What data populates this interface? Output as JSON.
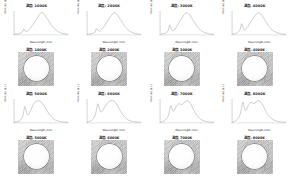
{
  "figure": {
    "background": "#ffffff",
    "curve_color": "#8a8a8a",
    "axis_color": "#6f6f6f",
    "rows": 4,
    "columns": 4
  },
  "axes": {
    "xlabel": "Wavelength (nm)",
    "ylabel": "Intensity (a.u.)"
  },
  "blocks": [
    {
      "spectra": [
        {
          "title": "温度: 1000K"
        },
        {
          "title": "温度: 2000K"
        },
        {
          "title": "温度: 3000K"
        },
        {
          "title": "温度: 4000K"
        }
      ],
      "images": [
        {
          "title": "温度: 1000K"
        },
        {
          "title": "温度: 2000K"
        },
        {
          "title": "温度: 3000K"
        },
        {
          "title": "温度: 4000K"
        }
      ]
    },
    {
      "spectra": [
        {
          "title": "温度: 5000K"
        },
        {
          "title": "温度: 6000K"
        },
        {
          "title": "温度: 7000K"
        },
        {
          "title": "温度: 8000K"
        }
      ],
      "images": [
        {
          "title": "温度: 5000K"
        },
        {
          "title": "温度: 6000K"
        },
        {
          "title": "温度: 7000K"
        },
        {
          "title": "温度: 8000K"
        }
      ]
    }
  ],
  "chart_data": {
    "type": "line",
    "title": "",
    "xlabel": "Wavelength (nm)",
    "ylabel": "Intensity (a.u.)",
    "xlim": [
      380,
      780
    ],
    "ylim": [
      0,
      1.05
    ],
    "grid": false,
    "legend": "none",
    "x": [
      380,
      400,
      420,
      440,
      450,
      460,
      470,
      480,
      490,
      500,
      510,
      520,
      530,
      540,
      550,
      560,
      570,
      580,
      590,
      600,
      610,
      620,
      630,
      640,
      650,
      660,
      680,
      700,
      720,
      740,
      760,
      780
    ],
    "series": [
      {
        "name": "温度: 1000K",
        "values": [
          0.02,
          0.03,
          0.05,
          0.12,
          0.26,
          0.2,
          0.14,
          0.16,
          0.22,
          0.3,
          0.38,
          0.46,
          0.55,
          0.64,
          0.74,
          0.84,
          0.93,
          0.99,
          1.0,
          0.96,
          0.88,
          0.78,
          0.7,
          0.6,
          0.5,
          0.41,
          0.27,
          0.17,
          0.1,
          0.06,
          0.04,
          0.02
        ]
      },
      {
        "name": "温度: 2000K",
        "values": [
          0.02,
          0.03,
          0.06,
          0.14,
          0.28,
          0.22,
          0.16,
          0.18,
          0.24,
          0.33,
          0.42,
          0.51,
          0.6,
          0.69,
          0.78,
          0.87,
          0.95,
          1.0,
          0.99,
          0.94,
          0.86,
          0.76,
          0.67,
          0.57,
          0.47,
          0.38,
          0.25,
          0.15,
          0.09,
          0.05,
          0.03,
          0.02
        ]
      },
      {
        "name": "温度: 3000K",
        "values": [
          0.02,
          0.04,
          0.08,
          0.2,
          0.44,
          0.3,
          0.18,
          0.19,
          0.25,
          0.34,
          0.44,
          0.54,
          0.64,
          0.74,
          0.84,
          0.92,
          0.98,
          1.0,
          0.97,
          0.9,
          0.81,
          0.71,
          0.62,
          0.52,
          0.43,
          0.34,
          0.22,
          0.13,
          0.08,
          0.05,
          0.03,
          0.02
        ]
      },
      {
        "name": "温度: 4000K",
        "values": [
          0.03,
          0.05,
          0.1,
          0.24,
          0.5,
          0.34,
          0.22,
          0.24,
          0.31,
          0.4,
          0.5,
          0.6,
          0.7,
          0.79,
          0.87,
          0.93,
          0.98,
          1.0,
          0.96,
          0.89,
          0.8,
          0.7,
          0.6,
          0.5,
          0.41,
          0.33,
          0.21,
          0.13,
          0.08,
          0.05,
          0.03,
          0.02
        ]
      },
      {
        "name": "温度: 5000K",
        "values": [
          0.02,
          0.04,
          0.09,
          0.22,
          0.46,
          0.74,
          0.52,
          0.36,
          0.4,
          0.52,
          0.66,
          0.8,
          0.9,
          0.96,
          0.99,
          1.0,
          0.98,
          0.94,
          0.88,
          0.8,
          0.7,
          0.6,
          0.5,
          0.4,
          0.32,
          0.25,
          0.15,
          0.09,
          0.06,
          0.04,
          0.03,
          0.02
        ]
      },
      {
        "name": "温度: 6000K",
        "values": [
          0.03,
          0.06,
          0.14,
          0.34,
          0.62,
          0.86,
          0.66,
          0.5,
          0.52,
          0.6,
          0.7,
          0.8,
          0.88,
          0.94,
          0.98,
          1.0,
          1.0,
          0.97,
          0.92,
          0.84,
          0.74,
          0.63,
          0.52,
          0.42,
          0.33,
          0.26,
          0.15,
          0.09,
          0.05,
          0.04,
          0.03,
          0.02
        ]
      },
      {
        "name": "温度: 7000K",
        "values": [
          0.03,
          0.06,
          0.13,
          0.3,
          0.56,
          0.78,
          0.6,
          0.52,
          0.62,
          0.74,
          0.82,
          0.86,
          0.84,
          0.82,
          0.86,
          0.92,
          0.97,
          1.0,
          0.98,
          0.92,
          0.82,
          0.7,
          0.58,
          0.46,
          0.36,
          0.28,
          0.17,
          0.1,
          0.06,
          0.04,
          0.03,
          0.02
        ]
      },
      {
        "name": "温度: 8000K",
        "values": [
          0.03,
          0.07,
          0.16,
          0.38,
          0.68,
          0.94,
          0.7,
          0.56,
          0.64,
          0.78,
          0.88,
          0.92,
          0.9,
          0.88,
          0.9,
          0.95,
          0.99,
          1.0,
          0.96,
          0.88,
          0.78,
          0.66,
          0.54,
          0.43,
          0.34,
          0.26,
          0.16,
          0.1,
          0.06,
          0.04,
          0.03,
          0.02
        ]
      }
    ]
  }
}
